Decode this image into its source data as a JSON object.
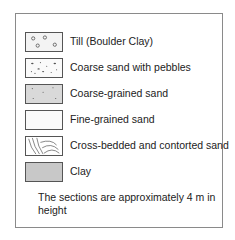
{
  "legend": {
    "items": [
      {
        "label": "Till (Boulder Clay)",
        "pattern": "circles",
        "fill": "#f3f3f3"
      },
      {
        "label": "Coarse sand with pebbles",
        "pattern": "pebbles-dots",
        "fill": "#fafafa"
      },
      {
        "label": "Coarse-grained sand",
        "pattern": "sparse-dots",
        "fill": "#d9d9d9"
      },
      {
        "label": "Fine-grained sand",
        "pattern": "plain",
        "fill": "#fafafa"
      },
      {
        "label": "Cross-bedded and contorted sand",
        "pattern": "curved-lines",
        "fill": "#ffffff"
      },
      {
        "label": "Clay",
        "pattern": "solid",
        "fill": "#c8c8c8"
      }
    ],
    "note": "The sections are approximately 4 m in height"
  }
}
